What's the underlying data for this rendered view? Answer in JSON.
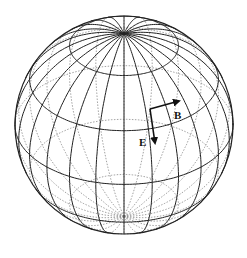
{
  "figure": {
    "type": "wireframe-sphere",
    "center": [
      124,
      125
    ],
    "radius": 109,
    "tilt_deg": 33,
    "meridian_count": 24,
    "parallels_deg": [
      -60,
      -30,
      0,
      30,
      60
    ],
    "front_line_color": "#222222",
    "back_line_color": "#8a8a8a",
    "background": "#ffffff"
  },
  "vectors": [
    {
      "label": "E",
      "name": "electric-field-vector",
      "from": [
        150,
        109
      ],
      "to": [
        155,
        143
      ],
      "label_pos": [
        139,
        146
      ]
    },
    {
      "label": "B",
      "name": "magnetic-field-vector",
      "from": [
        150,
        109
      ],
      "to": [
        179,
        101
      ],
      "label_pos": [
        174,
        119
      ]
    }
  ]
}
